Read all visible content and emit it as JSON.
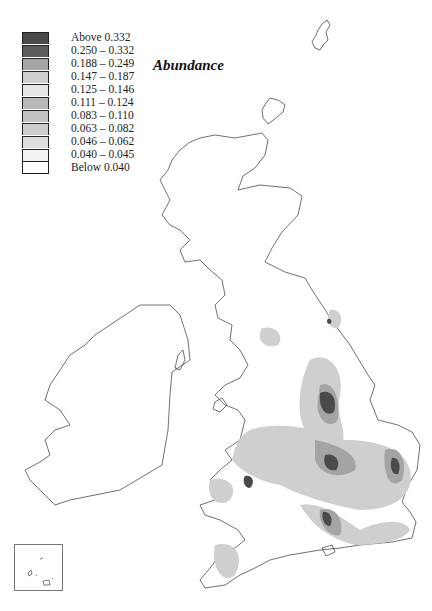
{
  "title": "Abundance",
  "legend": {
    "items": [
      {
        "label": "Above 0.332",
        "color": "#4a4a4a"
      },
      {
        "label": "0.250 – 0.332",
        "color": "#5c5c5c"
      },
      {
        "label": "0.188 – 0.249",
        "color": "#a4a4a4"
      },
      {
        "label": "0.147 – 0.187",
        "color": "#cfcfcf"
      },
      {
        "label": "0.125 – 0.146",
        "color": "#e6e6e6"
      },
      {
        "label": "0.111 – 0.124",
        "color": "#b8b8b8"
      },
      {
        "label": "0.083 – 0.110",
        "color": "#c2c2c2"
      },
      {
        "label": "0.063 – 0.082",
        "color": "#cdcdcd"
      },
      {
        "label": "0.046 – 0.062",
        "color": "#dddddd"
      },
      {
        "label": "0.040 – 0.045",
        "color": "#f3f3f3"
      },
      {
        "label": "Below 0.040",
        "color": "#ffffff"
      }
    ]
  },
  "map": {
    "regions": [
      "Great Britain",
      "Ireland",
      "Shetland",
      "Orkney",
      "Channel Islands inset"
    ],
    "outline_color": "#333333"
  }
}
